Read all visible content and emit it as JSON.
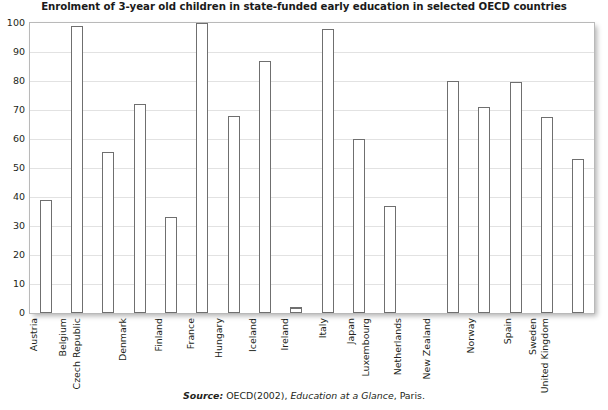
{
  "chart_data": {
    "type": "bar",
    "title": "Enrolment of 3-year old children in state-funded early education in selected OECD countries",
    "xlabel": "",
    "ylabel": "",
    "ylim": [
      0,
      100
    ],
    "yticks": [
      0,
      10,
      20,
      30,
      40,
      50,
      60,
      70,
      80,
      90,
      100
    ],
    "grid": true,
    "legend": "none",
    "bar_fill_color": "#ffffff",
    "bar_border_color": "#6f6f6f",
    "gridline_color": "#e2e2e2",
    "categories": [
      "Austria",
      "Belgium",
      "Czech Republic",
      "Denmark",
      "Finland",
      "France",
      "Hungary",
      "Iceland",
      "Ireland",
      "Italy",
      "Japan",
      "Luxembourg",
      "Netherlands",
      "New Zealand",
      "Norway",
      "Spain",
      "Sweden",
      "United Kingdom"
    ],
    "values": [
      39,
      99,
      55.5,
      72,
      33,
      100,
      68,
      87,
      2,
      98,
      60,
      37,
      0,
      80,
      71,
      79.5,
      67.5,
      53
    ]
  },
  "source": {
    "label": "Source:",
    "publisher": " OECD(2002), ",
    "publication": "Education at a Glance",
    "place": ", Paris."
  }
}
